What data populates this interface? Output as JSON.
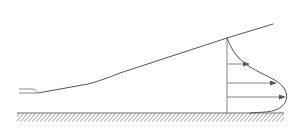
{
  "colors": {
    "line": "#555555",
    "hatch": "#888888",
    "nozzle": "#8a8a8a",
    "background": "#ffffff"
  },
  "elements": {
    "wall": {
      "label": "Wall (hatched ground surface)"
    },
    "nozzle": {
      "label": "Nozzle / slot outlet"
    },
    "jet_boundary": {
      "label": "Jet outer boundary (spreading edge)"
    },
    "measurement_station": {
      "label": "Vertical reference line"
    },
    "velocity_profile": {
      "label": "Wall-jet velocity profile"
    },
    "velocity_arrows": [
      {
        "label": "Velocity vector (upper)"
      },
      {
        "label": "Velocity vector (middle)"
      },
      {
        "label": "Velocity vector (near max)"
      }
    ]
  }
}
